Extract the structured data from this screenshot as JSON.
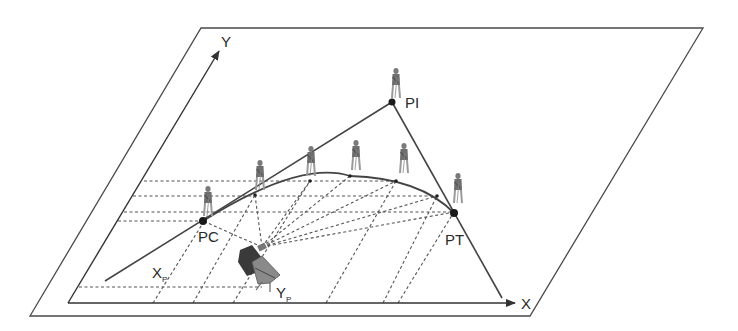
{
  "diagram": {
    "colors": {
      "line": "#4a4a4a",
      "dashed": "#555555",
      "point": "#1a1a1a",
      "figure": "#8a8a8a",
      "background": "#ffffff"
    },
    "axes": {
      "x_label": "X",
      "y_label": "Y"
    },
    "points": {
      "pc": "PC",
      "pi": "PI",
      "pt": "PT"
    },
    "coordinates": {
      "xp_main": "X",
      "xp_sub": "P",
      "yp_main": "Y",
      "yp_sub": "P"
    },
    "figures": {
      "rod_persons": 7,
      "instrument": "total-station-operator"
    }
  }
}
